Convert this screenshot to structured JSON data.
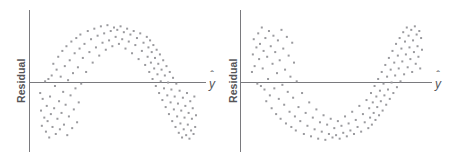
{
  "figure": {
    "width": 451,
    "height": 162,
    "background": "#ffffff",
    "axis_color": "#7a7a7e",
    "point_color": "#9a9a9e",
    "label_color": "#555558"
  },
  "panels": [
    {
      "id": "left",
      "name": "residual-plot-arch",
      "y_axis_label": "Residual",
      "x_axis_label": "y",
      "x_axis_label_hat": true,
      "pattern": "inverted-u"
    },
    {
      "id": "right",
      "name": "residual-plot-valley",
      "y_axis_label": "Residual",
      "x_axis_label": "y",
      "x_axis_label_hat": true,
      "pattern": "u-shape"
    }
  ],
  "chart_data": [
    {
      "type": "scatter",
      "title": "",
      "xlabel": "y-hat",
      "ylabel": "Residual",
      "grid": false,
      "legend": "none",
      "pattern": "inverted-u (arch) — curvature indicates a nonlinear relationship missed by the model",
      "xlim": [
        0,
        100
      ],
      "ylim": [
        -50,
        50
      ],
      "zero_line": 0,
      "marker": "square",
      "marker_size": 2,
      "color": "#9a9a9e",
      "n_points": 150,
      "points": [
        [
          5.0,
          -9.0
        ],
        [
          5.5,
          -24.0
        ],
        [
          6.0,
          -37.0
        ],
        [
          6.5,
          -14.0
        ],
        [
          7.5,
          -30.0
        ],
        [
          8.0,
          1.0
        ],
        [
          8.5,
          -42.0
        ],
        [
          9.0,
          -20.0
        ],
        [
          9.5,
          -33.0
        ],
        [
          10.0,
          3.0
        ],
        [
          10.5,
          -47.0
        ],
        [
          11.0,
          -12.0
        ],
        [
          11.5,
          -27.0
        ],
        [
          12.0,
          6.0
        ],
        [
          12.5,
          -38.0
        ],
        [
          13.0,
          16.0
        ],
        [
          13.5,
          -22.0
        ],
        [
          14.0,
          -3.0
        ],
        [
          14.5,
          -44.0
        ],
        [
          15.0,
          11.0
        ],
        [
          15.5,
          -31.0
        ],
        [
          16.0,
          22.0
        ],
        [
          16.5,
          -16.0
        ],
        [
          17.0,
          -40.0
        ],
        [
          17.5,
          5.0
        ],
        [
          18.0,
          -26.0
        ],
        [
          18.5,
          27.0
        ],
        [
          19.0,
          -8.0
        ],
        [
          19.5,
          -36.0
        ],
        [
          20.0,
          14.0
        ],
        [
          20.5,
          -19.0
        ],
        [
          21.0,
          31.0
        ],
        [
          21.5,
          -45.0
        ],
        [
          22.0,
          2.0
        ],
        [
          22.5,
          -29.0
        ],
        [
          23.0,
          19.0
        ],
        [
          23.5,
          -11.0
        ],
        [
          24.0,
          35.0
        ],
        [
          24.5,
          -39.0
        ],
        [
          25.0,
          8.0
        ],
        [
          25.5,
          -23.0
        ],
        [
          26.0,
          25.0
        ],
        [
          26.5,
          -5.0
        ],
        [
          27.0,
          38.0
        ],
        [
          27.5,
          -34.0
        ],
        [
          28.0,
          13.0
        ],
        [
          28.5,
          -17.0
        ],
        [
          29.0,
          29.0
        ],
        [
          29.5,
          41.0
        ],
        [
          30.0,
          -1.0
        ],
        [
          31.0,
          21.0
        ],
        [
          32.0,
          33.0
        ],
        [
          33.0,
          9.0
        ],
        [
          34.0,
          44.0
        ],
        [
          35.0,
          26.0
        ],
        [
          36.0,
          37.0
        ],
        [
          37.0,
          17.0
        ],
        [
          38.0,
          46.0
        ],
        [
          39.0,
          30.0
        ],
        [
          40.0,
          40.0
        ],
        [
          41.0,
          23.0
        ],
        [
          42.0,
          48.0
        ],
        [
          43.0,
          34.0
        ],
        [
          44.0,
          42.0
        ],
        [
          45.0,
          28.0
        ],
        [
          46.0,
          49.0
        ],
        [
          47.0,
          36.0
        ],
        [
          48.0,
          44.0
        ],
        [
          49.0,
          31.0
        ],
        [
          50.0,
          47.0
        ],
        [
          51.0,
          39.0
        ],
        [
          52.0,
          45.0
        ],
        [
          53.0,
          33.0
        ],
        [
          54.0,
          48.0
        ],
        [
          55.0,
          37.0
        ],
        [
          56.0,
          43.0
        ],
        [
          57.0,
          29.0
        ],
        [
          58.0,
          46.0
        ],
        [
          59.0,
          35.0
        ],
        [
          60.0,
          41.0
        ],
        [
          61.0,
          25.0
        ],
        [
          62.0,
          44.0
        ],
        [
          63.0,
          32.0
        ],
        [
          64.0,
          38.0
        ],
        [
          65.0,
          20.0
        ],
        [
          66.0,
          42.0
        ],
        [
          67.0,
          27.0
        ],
        [
          68.0,
          34.0
        ],
        [
          69.0,
          15.0
        ],
        [
          70.0,
          39.0
        ],
        [
          70.5,
          22.0
        ],
        [
          71.0,
          30.0
        ],
        [
          71.5,
          9.0
        ],
        [
          72.0,
          36.0
        ],
        [
          72.5,
          17.0
        ],
        [
          73.0,
          26.0
        ],
        [
          73.5,
          3.0
        ],
        [
          74.0,
          32.0
        ],
        [
          74.5,
          12.0
        ],
        [
          75.0,
          21.0
        ],
        [
          75.5,
          -3.0
        ],
        [
          76.0,
          28.0
        ],
        [
          76.5,
          7.0
        ],
        [
          77.0,
          16.0
        ],
        [
          77.5,
          -9.0
        ],
        [
          78.0,
          24.0
        ],
        [
          78.5,
          1.0
        ],
        [
          79.0,
          11.0
        ],
        [
          79.5,
          -15.0
        ],
        [
          80.0,
          19.0
        ],
        [
          80.5,
          -5.0
        ],
        [
          81.0,
          6.0
        ],
        [
          81.5,
          -21.0
        ],
        [
          82.0,
          14.0
        ],
        [
          82.5,
          -11.0
        ],
        [
          83.0,
          0.0
        ],
        [
          83.5,
          -27.0
        ],
        [
          84.0,
          9.0
        ],
        [
          84.5,
          -17.0
        ],
        [
          85.0,
          -6.0
        ],
        [
          85.5,
          -33.0
        ],
        [
          86.0,
          4.0
        ],
        [
          86.5,
          -23.0
        ],
        [
          87.0,
          -12.0
        ],
        [
          87.5,
          -38.0
        ],
        [
          88.0,
          -1.0
        ],
        [
          88.5,
          -29.0
        ],
        [
          89.0,
          -18.0
        ],
        [
          89.5,
          -43.0
        ],
        [
          90.0,
          -7.0
        ],
        [
          90.5,
          -35.0
        ],
        [
          91.0,
          -24.0
        ],
        [
          91.5,
          -47.0
        ],
        [
          92.0,
          -13.0
        ],
        [
          92.5,
          -40.0
        ],
        [
          93.0,
          -30.0
        ],
        [
          93.5,
          -20.0
        ],
        [
          94.0,
          -45.0
        ],
        [
          94.5,
          -9.0
        ],
        [
          95.0,
          -36.0
        ],
        [
          95.5,
          -26.0
        ],
        [
          96.0,
          -48.0
        ],
        [
          96.5,
          -16.0
        ],
        [
          97.0,
          -41.0
        ],
        [
          97.5,
          -31.0
        ],
        [
          98.0,
          -22.0
        ],
        [
          98.5,
          -44.0
        ],
        [
          99.0,
          -12.0
        ],
        [
          99.5,
          -38.0
        ],
        [
          100.0,
          -28.0
        ]
      ]
    },
    {
      "type": "scatter",
      "title": "",
      "xlabel": "y-hat",
      "ylabel": "Residual",
      "grid": false,
      "legend": "none",
      "pattern": "u-shape (valley) — curvature indicates a nonlinear relationship missed by the model",
      "xlim": [
        0,
        100
      ],
      "ylim": [
        -50,
        50
      ],
      "zero_line": 0,
      "marker": "square",
      "marker_size": 2,
      "color": "#9a9a9e",
      "n_points": 150,
      "points": [
        [
          5.0,
          9.0
        ],
        [
          5.5,
          24.0
        ],
        [
          6.0,
          37.0
        ],
        [
          6.5,
          14.0
        ],
        [
          7.5,
          30.0
        ],
        [
          8.0,
          -1.0
        ],
        [
          8.5,
          42.0
        ],
        [
          9.0,
          20.0
        ],
        [
          9.5,
          33.0
        ],
        [
          10.0,
          -3.0
        ],
        [
          10.5,
          47.0
        ],
        [
          11.0,
          12.0
        ],
        [
          11.5,
          27.0
        ],
        [
          12.0,
          -6.0
        ],
        [
          12.5,
          38.0
        ],
        [
          13.0,
          -16.0
        ],
        [
          13.5,
          22.0
        ],
        [
          14.0,
          3.0
        ],
        [
          14.5,
          44.0
        ],
        [
          15.0,
          -11.0
        ],
        [
          15.5,
          31.0
        ],
        [
          16.0,
          -22.0
        ],
        [
          16.5,
          16.0
        ],
        [
          17.0,
          40.0
        ],
        [
          17.5,
          -5.0
        ],
        [
          18.0,
          26.0
        ],
        [
          18.5,
          -27.0
        ],
        [
          19.0,
          8.0
        ],
        [
          19.5,
          36.0
        ],
        [
          20.0,
          -14.0
        ],
        [
          20.5,
          19.0
        ],
        [
          21.0,
          -31.0
        ],
        [
          21.5,
          45.0
        ],
        [
          22.0,
          -2.0
        ],
        [
          22.5,
          29.0
        ],
        [
          23.0,
          -19.0
        ],
        [
          23.5,
          11.0
        ],
        [
          24.0,
          -35.0
        ],
        [
          24.5,
          39.0
        ],
        [
          25.0,
          -8.0
        ],
        [
          25.5,
          23.0
        ],
        [
          26.0,
          -25.0
        ],
        [
          26.5,
          5.0
        ],
        [
          27.0,
          -38.0
        ],
        [
          27.5,
          34.0
        ],
        [
          28.0,
          -13.0
        ],
        [
          28.5,
          17.0
        ],
        [
          29.0,
          -29.0
        ],
        [
          29.5,
          -41.0
        ],
        [
          30.0,
          1.0
        ],
        [
          31.0,
          -21.0
        ],
        [
          32.0,
          -33.0
        ],
        [
          33.0,
          -9.0
        ],
        [
          34.0,
          -44.0
        ],
        [
          35.0,
          -26.0
        ],
        [
          36.0,
          -37.0
        ],
        [
          37.0,
          -17.0
        ],
        [
          38.0,
          -46.0
        ],
        [
          39.0,
          -30.0
        ],
        [
          40.0,
          -40.0
        ],
        [
          41.0,
          -23.0
        ],
        [
          42.0,
          -48.0
        ],
        [
          43.0,
          -34.0
        ],
        [
          44.0,
          -42.0
        ],
        [
          45.0,
          -28.0
        ],
        [
          46.0,
          -49.0
        ],
        [
          47.0,
          -36.0
        ],
        [
          48.0,
          -44.0
        ],
        [
          49.0,
          -31.0
        ],
        [
          50.0,
          -47.0
        ],
        [
          51.0,
          -39.0
        ],
        [
          52.0,
          -45.0
        ],
        [
          53.0,
          -33.0
        ],
        [
          54.0,
          -48.0
        ],
        [
          55.0,
          -37.0
        ],
        [
          56.0,
          -43.0
        ],
        [
          57.0,
          -29.0
        ],
        [
          58.0,
          -46.0
        ],
        [
          59.0,
          -35.0
        ],
        [
          60.0,
          -41.0
        ],
        [
          61.0,
          -25.0
        ],
        [
          62.0,
          -44.0
        ],
        [
          63.0,
          -32.0
        ],
        [
          64.0,
          -38.0
        ],
        [
          65.0,
          -20.0
        ],
        [
          66.0,
          -42.0
        ],
        [
          67.0,
          -27.0
        ],
        [
          68.0,
          -34.0
        ],
        [
          69.0,
          -15.0
        ],
        [
          70.0,
          -39.0
        ],
        [
          70.5,
          -22.0
        ],
        [
          71.0,
          -30.0
        ],
        [
          71.5,
          -9.0
        ],
        [
          72.0,
          -36.0
        ],
        [
          72.5,
          -17.0
        ],
        [
          73.0,
          -26.0
        ],
        [
          73.5,
          -3.0
        ],
        [
          74.0,
          -32.0
        ],
        [
          74.5,
          -12.0
        ],
        [
          75.0,
          -21.0
        ],
        [
          75.5,
          3.0
        ],
        [
          76.0,
          -28.0
        ],
        [
          76.5,
          -7.0
        ],
        [
          77.0,
          -16.0
        ],
        [
          77.5,
          9.0
        ],
        [
          78.0,
          -24.0
        ],
        [
          78.5,
          -1.0
        ],
        [
          79.0,
          -11.0
        ],
        [
          79.5,
          15.0
        ],
        [
          80.0,
          -19.0
        ],
        [
          80.5,
          5.0
        ],
        [
          81.0,
          -6.0
        ],
        [
          81.5,
          21.0
        ],
        [
          82.0,
          -14.0
        ],
        [
          82.5,
          11.0
        ],
        [
          83.0,
          0.0
        ],
        [
          83.5,
          27.0
        ],
        [
          84.0,
          -9.0
        ],
        [
          84.5,
          17.0
        ],
        [
          85.0,
          6.0
        ],
        [
          85.5,
          33.0
        ],
        [
          86.0,
          -4.0
        ],
        [
          86.5,
          23.0
        ],
        [
          87.0,
          12.0
        ],
        [
          87.5,
          38.0
        ],
        [
          88.0,
          1.0
        ],
        [
          88.5,
          29.0
        ],
        [
          89.0,
          18.0
        ],
        [
          89.5,
          43.0
        ],
        [
          90.0,
          7.0
        ],
        [
          90.5,
          35.0
        ],
        [
          91.0,
          24.0
        ],
        [
          91.5,
          47.0
        ],
        [
          92.0,
          13.0
        ],
        [
          92.5,
          40.0
        ],
        [
          93.0,
          30.0
        ],
        [
          93.5,
          20.0
        ],
        [
          94.0,
          45.0
        ],
        [
          94.5,
          9.0
        ],
        [
          95.0,
          36.0
        ],
        [
          95.5,
          26.0
        ],
        [
          96.0,
          48.0
        ],
        [
          96.5,
          16.0
        ],
        [
          97.0,
          41.0
        ],
        [
          97.5,
          31.0
        ],
        [
          98.0,
          22.0
        ],
        [
          98.5,
          44.0
        ],
        [
          99.0,
          12.0
        ],
        [
          99.5,
          38.0
        ],
        [
          100.0,
          28.0
        ]
      ]
    }
  ]
}
